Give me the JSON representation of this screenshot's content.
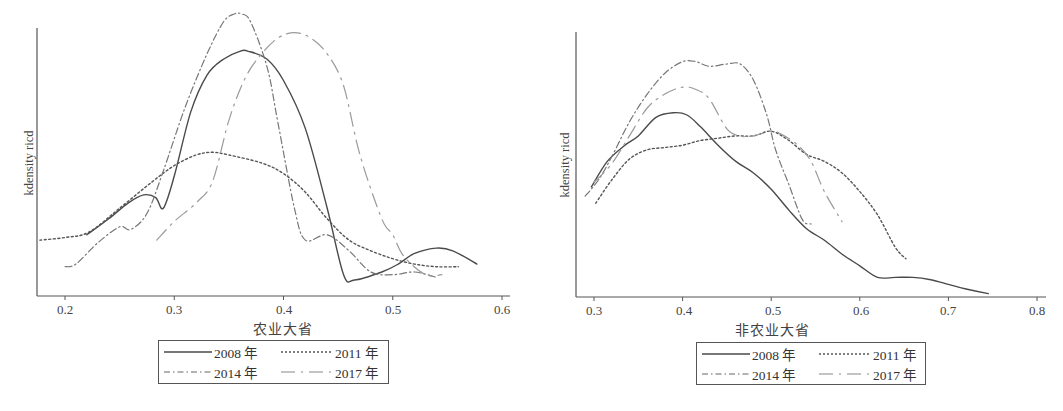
{
  "chart_data": [
    {
      "type": "line",
      "title": "",
      "xlabel": "农业大省",
      "ylabel": "kdensity ricd",
      "xlim": [
        0.174,
        0.607
      ],
      "ylim": [
        0,
        1
      ],
      "xticks": [
        0.2,
        0.3,
        0.4,
        0.5,
        0.6
      ],
      "xtick_labels": [
        "0.2",
        "0.3",
        "0.4",
        "0.5",
        "0.6"
      ],
      "grid": false,
      "legend_position": "bottom",
      "series": [
        {
          "name": "2008年",
          "style": "solid",
          "x": [
            0.22,
            0.24,
            0.258,
            0.272,
            0.283,
            0.29,
            0.3,
            0.315,
            0.33,
            0.345,
            0.36,
            0.368,
            0.385,
            0.4,
            0.42,
            0.44,
            0.455,
            0.465,
            0.49,
            0.505,
            0.52,
            0.54,
            0.555,
            0.577
          ],
          "y": [
            0.2,
            0.26,
            0.32,
            0.35,
            0.34,
            0.3,
            0.42,
            0.66,
            0.8,
            0.86,
            0.89,
            0.89,
            0.86,
            0.78,
            0.6,
            0.3,
            0.05,
            0.03,
            0.06,
            0.09,
            0.13,
            0.15,
            0.14,
            0.09
          ]
        },
        {
          "name": "2011年",
          "style": "dotted",
          "x": [
            0.177,
            0.2,
            0.222,
            0.25,
            0.28,
            0.3,
            0.32,
            0.335,
            0.35,
            0.38,
            0.4,
            0.42,
            0.44,
            0.46,
            0.48,
            0.5,
            0.52,
            0.54,
            0.56
          ],
          "y": [
            0.18,
            0.19,
            0.21,
            0.3,
            0.4,
            0.46,
            0.5,
            0.51,
            0.5,
            0.47,
            0.43,
            0.36,
            0.26,
            0.18,
            0.14,
            0.11,
            0.09,
            0.08,
            0.08
          ]
        },
        {
          "name": "2014年",
          "style": "dashdot",
          "x": [
            0.2,
            0.21,
            0.23,
            0.25,
            0.26,
            0.275,
            0.29,
            0.31,
            0.33,
            0.345,
            0.355,
            0.362,
            0.37,
            0.385,
            0.395,
            0.41,
            0.42,
            0.44,
            0.46,
            0.48,
            0.5,
            0.52,
            0.54
          ],
          "y": [
            0.08,
            0.09,
            0.17,
            0.23,
            0.22,
            0.28,
            0.44,
            0.68,
            0.88,
            1.0,
            1.03,
            1.03,
            1.0,
            0.83,
            0.62,
            0.3,
            0.18,
            0.2,
            0.14,
            0.06,
            0.05,
            0.06,
            0.04
          ]
        },
        {
          "name": "2017年",
          "style": "longdash",
          "x": [
            0.284,
            0.3,
            0.32,
            0.335,
            0.35,
            0.365,
            0.38,
            0.395,
            0.41,
            0.425,
            0.44,
            0.455,
            0.47,
            0.49,
            0.5,
            0.51,
            0.53,
            0.545
          ],
          "y": [
            0.18,
            0.25,
            0.32,
            0.4,
            0.63,
            0.79,
            0.88,
            0.94,
            0.96,
            0.94,
            0.88,
            0.76,
            0.5,
            0.26,
            0.2,
            0.12,
            0.05,
            0.05
          ]
        }
      ]
    },
    {
      "type": "line",
      "title": "",
      "xlabel": "非农业大省",
      "ylabel": "kdensity ricd",
      "xlim": [
        0.28,
        0.809
      ],
      "ylim": [
        0,
        1
      ],
      "xticks": [
        0.3,
        0.4,
        0.5,
        0.6,
        0.7,
        0.8
      ],
      "xtick_labels": [
        "0.3",
        "0.4",
        "0.5",
        "0.6",
        "0.7",
        "0.8"
      ],
      "grid": false,
      "legend_position": "bottom",
      "series": [
        {
          "name": "2008年",
          "style": "solid",
          "x": [
            0.297,
            0.315,
            0.335,
            0.35,
            0.37,
            0.39,
            0.405,
            0.42,
            0.44,
            0.46,
            0.48,
            0.5,
            0.52,
            0.54,
            0.56,
            0.58,
            0.6,
            0.62,
            0.64,
            0.66,
            0.68,
            0.7,
            0.72,
            0.745
          ],
          "y": [
            0.44,
            0.55,
            0.62,
            0.66,
            0.74,
            0.76,
            0.75,
            0.7,
            0.62,
            0.55,
            0.5,
            0.43,
            0.34,
            0.26,
            0.21,
            0.15,
            0.1,
            0.05,
            0.05,
            0.05,
            0.04,
            0.02,
            0.0,
            -0.02
          ]
        },
        {
          "name": "2011年",
          "style": "dotted",
          "x": [
            0.302,
            0.32,
            0.34,
            0.36,
            0.38,
            0.4,
            0.42,
            0.44,
            0.46,
            0.48,
            0.5,
            0.52,
            0.54,
            0.56,
            0.58,
            0.6,
            0.62,
            0.64,
            0.652
          ],
          "y": [
            0.37,
            0.47,
            0.56,
            0.6,
            0.61,
            0.62,
            0.64,
            0.65,
            0.66,
            0.66,
            0.68,
            0.64,
            0.58,
            0.55,
            0.5,
            0.42,
            0.32,
            0.18,
            0.13
          ]
        },
        {
          "name": "2014年",
          "style": "dashdot",
          "x": [
            0.29,
            0.305,
            0.32,
            0.34,
            0.36,
            0.38,
            0.4,
            0.415,
            0.43,
            0.45,
            0.465,
            0.48,
            0.495,
            0.505,
            0.52,
            0.535,
            0.545
          ],
          "y": [
            0.4,
            0.47,
            0.57,
            0.72,
            0.84,
            0.93,
            0.98,
            0.98,
            0.96,
            0.97,
            0.97,
            0.9,
            0.75,
            0.6,
            0.45,
            0.3,
            0.28
          ]
        },
        {
          "name": "2017年",
          "style": "longdash",
          "x": [
            0.3,
            0.32,
            0.34,
            0.36,
            0.38,
            0.4,
            0.415,
            0.43,
            0.45,
            0.465,
            0.48,
            0.5,
            0.51,
            0.53,
            0.545,
            0.56,
            0.58
          ],
          "y": [
            0.46,
            0.54,
            0.66,
            0.78,
            0.84,
            0.87,
            0.86,
            0.82,
            0.69,
            0.66,
            0.66,
            0.68,
            0.67,
            0.62,
            0.55,
            0.42,
            0.29
          ]
        }
      ]
    }
  ],
  "charts": {
    "left": {
      "xlabel": "农业大省",
      "ylabel": "kdensity ricd",
      "ticks": [
        "0.2",
        "0.3",
        "0.4",
        "0.5",
        "0.6"
      ],
      "legend": [
        "2008 年",
        "2011 年",
        "2014 年",
        "2017 年"
      ]
    },
    "right": {
      "xlabel": "非农业大省",
      "ylabel": "kdensity ricd",
      "ticks": [
        "0.3",
        "0.4",
        "0.5",
        "0.6",
        "0.7",
        "0.8"
      ],
      "legend": [
        "2008 年",
        "2011 年",
        "2014 年",
        "2017 年"
      ]
    }
  },
  "colors": {
    "axis": "#555555",
    "s2008": "#4a4a4a",
    "s2011": "#555555",
    "s2014": "#777777",
    "s2017": "#9a9a9a"
  }
}
